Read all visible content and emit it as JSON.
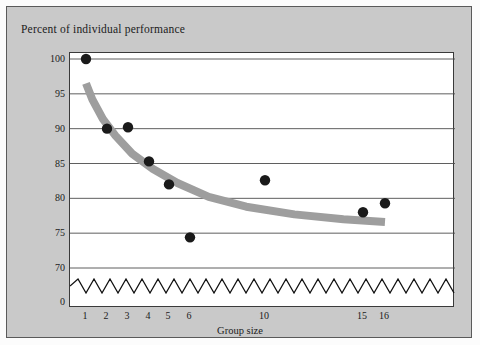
{
  "figure": {
    "background_color": "#c9c9c9",
    "plot_background_color": "#ffffff",
    "frame_color": "#5a5a5a"
  },
  "chart_data": {
    "type": "scatter",
    "title": "Percent of individual performance",
    "xlabel": "Group size",
    "ylabel": "",
    "grid": true,
    "legend": "none",
    "xlim": [
      0,
      18
    ],
    "ylim": [
      70,
      100
    ],
    "y_axis_break": true,
    "y_break_label": "0",
    "xtick_labels": [
      "1",
      "2",
      "3",
      "4",
      "5",
      "6",
      "10",
      "15",
      "16"
    ],
    "xtick_values": [
      1,
      2,
      3,
      4,
      5,
      6,
      10,
      15,
      16
    ],
    "ytick_labels": [
      "100",
      "95",
      "90",
      "85",
      "80",
      "75",
      "70"
    ],
    "ytick_values": [
      100,
      95,
      90,
      85,
      80,
      75,
      70
    ],
    "point_color": "#1a1a1a",
    "trend_color": "#9e9e9e",
    "points": [
      {
        "x": 1,
        "y": 100.0
      },
      {
        "x": 2,
        "y": 90.0
      },
      {
        "x": 3,
        "y": 90.2
      },
      {
        "x": 4,
        "y": 85.3
      },
      {
        "x": 5,
        "y": 82.0
      },
      {
        "x": 6,
        "y": 74.4
      },
      {
        "x": 10,
        "y": 82.6
      },
      {
        "x": 15,
        "y": 78.0
      },
      {
        "x": 16,
        "y": 79.3
      }
    ],
    "trend_curve": {
      "name": "fitted decline curve",
      "x": [
        1.0,
        1.3,
        1.8,
        2.4,
        3.2,
        4.2,
        5.4,
        7.0,
        9.0,
        11.5,
        14.0,
        16.5
      ],
      "y": [
        96.5,
        94.2,
        91.4,
        89.0,
        86.4,
        84.2,
        82.2,
        80.2,
        78.8,
        77.7,
        77.0,
        76.6
      ]
    }
  }
}
